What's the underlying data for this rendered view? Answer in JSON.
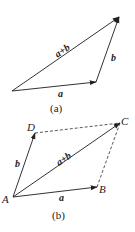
{
  "figure_a": {
    "caption": "(a)",
    "labels": {
      "sum": "a+b",
      "a": "a",
      "b": "b"
    },
    "points": {
      "origin": [
        12,
        91
      ],
      "a_end": [
        96,
        82
      ],
      "apex": [
        119,
        17
      ]
    }
  },
  "figure_b": {
    "caption": "(b)",
    "labels": {
      "sum": "a+b",
      "a": "a",
      "b": "b"
    },
    "vertices": {
      "A": {
        "label": "A",
        "xy": [
          13,
          197
        ]
      },
      "B": {
        "label": "B",
        "xy": [
          97,
          187
        ]
      },
      "C": {
        "label": "C",
        "xy": [
          120,
          123
        ]
      },
      "D": {
        "label": "D",
        "xy": [
          35,
          133
        ]
      }
    }
  },
  "colors": {
    "stroke": "#333333",
    "text": "#222222",
    "background": "#ffffff"
  }
}
